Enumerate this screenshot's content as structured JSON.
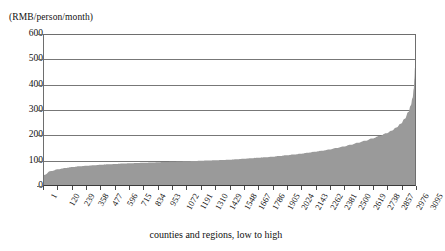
{
  "chart_data": {
    "type": "area",
    "title": "",
    "unit_label": "(RMB/person/month)",
    "xlabel": "counties and regions, low to high",
    "ylabel": "",
    "ylim": [
      0,
      600
    ],
    "yticks": [
      0,
      100,
      200,
      300,
      400,
      500,
      600
    ],
    "xlim": [
      1,
      3095
    ],
    "xticks": [
      1,
      120,
      239,
      358,
      477,
      596,
      715,
      834,
      953,
      1072,
      1191,
      1310,
      1429,
      1548,
      1667,
      1786,
      1905,
      2024,
      2143,
      2262,
      2381,
      2500,
      2619,
      2738,
      2857,
      2976,
      3095
    ],
    "xtick_labels": [
      "1",
      "120",
      "239",
      "358",
      "477",
      "596",
      "715",
      "834",
      "953",
      "1072",
      "1191",
      "1310",
      "1429",
      "1548",
      "1667",
      "1786",
      "1905",
      "2024",
      "2143",
      "2262",
      "2381",
      "2500",
      "2619",
      "2738",
      "2857",
      "2976",
      "3095"
    ],
    "grid": true,
    "legend": null,
    "series_name": "fiscal expenditure per capita",
    "fill_color": "#9a9a9a",
    "axis_color": "#6e6e6e",
    "grid_color": "#777777",
    "x": [
      1,
      60,
      120,
      180,
      239,
      300,
      358,
      420,
      477,
      540,
      596,
      660,
      715,
      780,
      834,
      900,
      953,
      1010,
      1072,
      1130,
      1191,
      1250,
      1310,
      1370,
      1429,
      1490,
      1548,
      1610,
      1667,
      1730,
      1786,
      1850,
      1905,
      1965,
      2024,
      2085,
      2143,
      2200,
      2262,
      2320,
      2381,
      2440,
      2500,
      2560,
      2619,
      2680,
      2738,
      2800,
      2857,
      2900,
      2940,
      2976,
      3010,
      3040,
      3060,
      3075,
      3085,
      3090,
      3095
    ],
    "y": [
      40,
      56,
      63,
      68,
      72,
      75,
      77,
      79,
      81,
      83,
      84,
      86,
      87,
      88,
      89,
      90,
      91,
      92,
      93,
      94,
      95,
      96,
      97,
      98,
      99,
      100,
      101,
      103,
      105,
      107,
      109,
      111,
      113,
      116,
      119,
      122,
      125,
      129,
      133,
      137,
      142,
      148,
      154,
      161,
      169,
      177,
      186,
      196,
      207,
      217,
      230,
      245,
      265,
      292,
      318,
      348,
      385,
      425,
      470
    ]
  }
}
